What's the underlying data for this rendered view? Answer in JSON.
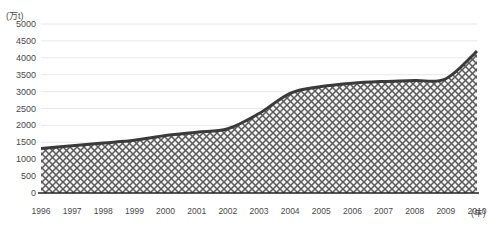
{
  "chart_data": {
    "type": "area",
    "title": "",
    "subtitle": "",
    "xlabel": "(年)",
    "ylabel": "(万t)",
    "x": [
      1996,
      1997,
      1998,
      1999,
      2000,
      2001,
      2002,
      2003,
      2004,
      2005,
      2006,
      2007,
      2008,
      2009,
      2010
    ],
    "categories": [
      "1996",
      "1997",
      "1998",
      "1999",
      "2000",
      "2001",
      "2002",
      "2003",
      "2004",
      "2005",
      "2006",
      "2007",
      "2008",
      "2009",
      "2010"
    ],
    "values": [
      1320,
      1400,
      1480,
      1560,
      1700,
      1800,
      1900,
      2350,
      2950,
      3150,
      3250,
      3300,
      3330,
      3380,
      4200
    ],
    "series": [
      {
        "name": "",
        "values": [
          1320,
          1400,
          1480,
          1560,
          1700,
          1800,
          1900,
          2350,
          2950,
          3150,
          3250,
          3300,
          3330,
          3380,
          4200
        ]
      }
    ],
    "ylim": [
      0,
      5000
    ],
    "ytick_step": 500,
    "yticks": [
      0,
      500,
      1000,
      1500,
      2000,
      2500,
      3000,
      3500,
      4000,
      4500,
      5000
    ],
    "ytick_labels": [
      "0",
      "500",
      "1000",
      "1500",
      "2000",
      "2500",
      "3000",
      "3500",
      "4000",
      "4500",
      "5000"
    ],
    "xtick_labels": [
      "1996",
      "1997",
      "1998",
      "1999",
      "2000",
      "2001",
      "2002",
      "2003",
      "2004",
      "2005",
      "2006",
      "2007",
      "2008",
      "2009",
      "2010"
    ],
    "grid": true,
    "grid_axis": "y",
    "legend": false,
    "legend_position": "none",
    "fill_pattern": "crosshatch-diagonal",
    "colors": {
      "line": "#3a3a3a",
      "fill_background": "#f2f2f2",
      "fill_hatch": "#555555",
      "grid": "#e8e8e8",
      "axis": "#333333",
      "text": "#4a4a4a"
    }
  }
}
